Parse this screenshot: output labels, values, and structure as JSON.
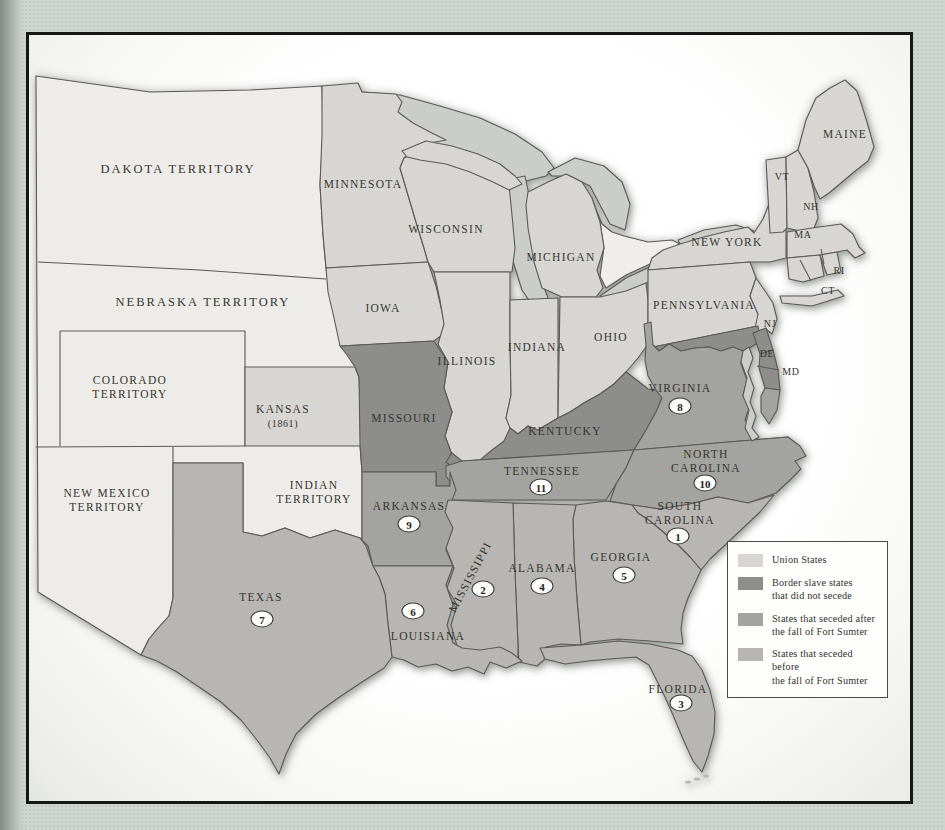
{
  "palette": {
    "territory": "#edece8",
    "union": "#d7d6d2",
    "border_slave": "#8d8d8b",
    "seceded_after": "#a3a3a0",
    "seceded_before": "#b7b6b3",
    "lake": "#cbcdc9",
    "line": "#5a5a58",
    "page_bg": "#cfd6d2",
    "frame_border": "#161616",
    "label_text": "#35352f"
  },
  "legend": {
    "items": [
      {
        "key": "union",
        "label": "Union States"
      },
      {
        "key": "border_slave",
        "label": "Border slave states\nthat did not secede"
      },
      {
        "key": "seceded_after",
        "label": "States that seceded after\nthe fall of Fort Sumter"
      },
      {
        "key": "seceded_before",
        "label": "States that seceded before\nthe fall of Fort Sumter"
      }
    ]
  },
  "map": {
    "labels": [
      {
        "id": "dakota-territory",
        "text": "DAKOTA TERRITORY",
        "x": 178,
        "y": 170,
        "size": "lg"
      },
      {
        "id": "nebraska-territory",
        "text": "NEBRASKA TERRITORY",
        "x": 203,
        "y": 303,
        "size": "lg"
      },
      {
        "id": "colorado-territory",
        "text": "COLORADO\nTERRITORY",
        "x": 130,
        "y": 387,
        "size": "md"
      },
      {
        "id": "new-mexico-territory",
        "text": "NEW MEXICO\nTERRITORY",
        "x": 107,
        "y": 500,
        "size": "md"
      },
      {
        "id": "indian-territory",
        "text": "INDIAN\nTERRITORY",
        "x": 314,
        "y": 492,
        "size": "md"
      },
      {
        "id": "kansas",
        "text": "KANSAS",
        "x": 283,
        "y": 409,
        "size": "md"
      },
      {
        "id": "kansas-year",
        "text": "(1861)",
        "x": 283,
        "y": 424,
        "size": "sm"
      },
      {
        "id": "minnesota",
        "text": "MINNESOTA",
        "x": 363,
        "y": 184,
        "size": "md"
      },
      {
        "id": "wisconsin",
        "text": "WISCONSIN",
        "x": 446,
        "y": 229,
        "size": "md"
      },
      {
        "id": "iowa",
        "text": "IOWA",
        "x": 383,
        "y": 308,
        "size": "md"
      },
      {
        "id": "michigan",
        "text": "MICHIGAN",
        "x": 561,
        "y": 257,
        "size": "md"
      },
      {
        "id": "illinois",
        "text": "ILLINOIS",
        "x": 467,
        "y": 361,
        "size": "md"
      },
      {
        "id": "indiana",
        "text": "INDIANA",
        "x": 537,
        "y": 347,
        "size": "md"
      },
      {
        "id": "ohio",
        "text": "OHIO",
        "x": 611,
        "y": 337,
        "size": "md"
      },
      {
        "id": "new-york",
        "text": "NEW YORK",
        "x": 727,
        "y": 242,
        "size": "md"
      },
      {
        "id": "pennsylvania",
        "text": "PENNSYLVANIA",
        "x": 704,
        "y": 305,
        "size": "md"
      },
      {
        "id": "maine",
        "text": "MAINE",
        "x": 845,
        "y": 134,
        "size": "md"
      },
      {
        "id": "vermont",
        "text": "VT",
        "x": 782,
        "y": 177,
        "size": "sm"
      },
      {
        "id": "new-hampshire",
        "text": "NH",
        "x": 811,
        "y": 207,
        "size": "sm"
      },
      {
        "id": "massachusetts",
        "text": "MA",
        "x": 803,
        "y": 235,
        "size": "sm"
      },
      {
        "id": "rhode-island",
        "text": "RI",
        "x": 839,
        "y": 271,
        "size": "sm"
      },
      {
        "id": "connecticut",
        "text": "CT",
        "x": 828,
        "y": 291,
        "size": "sm"
      },
      {
        "id": "new-jersey",
        "text": "NJ",
        "x": 770,
        "y": 324,
        "size": "sm"
      },
      {
        "id": "delaware",
        "text": "DE",
        "x": 767,
        "y": 354,
        "size": "sm"
      },
      {
        "id": "maryland",
        "text": "MD",
        "x": 791,
        "y": 372,
        "size": "sm"
      },
      {
        "id": "missouri",
        "text": "MISSOURI",
        "x": 404,
        "y": 418,
        "size": "md"
      },
      {
        "id": "kentucky",
        "text": "KENTUCKY",
        "x": 565,
        "y": 431,
        "size": "md"
      },
      {
        "id": "virginia",
        "text": "VIRGINIA",
        "x": 680,
        "y": 388,
        "size": "md"
      },
      {
        "id": "tennessee",
        "text": "TENNESSEE",
        "x": 542,
        "y": 471,
        "size": "md"
      },
      {
        "id": "north-carolina",
        "text": "NORTH\nCAROLINA",
        "x": 706,
        "y": 461,
        "size": "md"
      },
      {
        "id": "south-carolina",
        "text": "SOUTH\nCAROLINA",
        "x": 680,
        "y": 513,
        "size": "md"
      },
      {
        "id": "arkansas",
        "text": "ARKANSAS",
        "x": 409,
        "y": 506,
        "size": "md"
      },
      {
        "id": "georgia",
        "text": "GEORGIA",
        "x": 621,
        "y": 557,
        "size": "md"
      },
      {
        "id": "alabama",
        "text": "ALABAMA",
        "x": 542,
        "y": 568,
        "size": "md"
      },
      {
        "id": "mississippi",
        "text": "MISSISSIPPI",
        "x": 470,
        "y": 577,
        "size": "md",
        "rotate": -62
      },
      {
        "id": "louisiana",
        "text": "LOUISIANA",
        "x": 428,
        "y": 636,
        "size": "md"
      },
      {
        "id": "texas",
        "text": "TEXAS",
        "x": 261,
        "y": 597,
        "size": "md"
      },
      {
        "id": "florida",
        "text": "FLORIDA",
        "x": 678,
        "y": 689,
        "size": "md"
      }
    ],
    "numbers": [
      {
        "n": "1",
        "state": "south-carolina",
        "x": 678,
        "y": 536
      },
      {
        "n": "2",
        "state": "mississippi",
        "x": 483,
        "y": 589
      },
      {
        "n": "3",
        "state": "florida",
        "x": 681,
        "y": 703
      },
      {
        "n": "4",
        "state": "alabama",
        "x": 542,
        "y": 586
      },
      {
        "n": "5",
        "state": "georgia",
        "x": 624,
        "y": 575
      },
      {
        "n": "6",
        "state": "louisiana",
        "x": 413,
        "y": 611
      },
      {
        "n": "7",
        "state": "texas",
        "x": 262,
        "y": 619
      },
      {
        "n": "8",
        "state": "virginia",
        "x": 680,
        "y": 406
      },
      {
        "n": "9",
        "state": "arkansas",
        "x": 409,
        "y": 524
      },
      {
        "n": "10",
        "state": "north-carolina",
        "x": 705,
        "y": 483
      },
      {
        "n": "11",
        "state": "tennessee",
        "x": 541,
        "y": 487
      }
    ]
  }
}
